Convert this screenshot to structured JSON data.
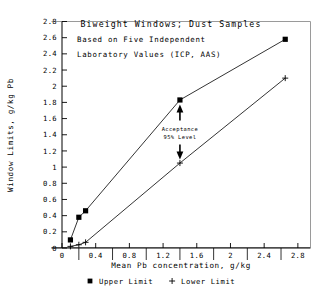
{
  "chart_data": {
    "type": "line",
    "title": "Biweight Windows; Dust Samples",
    "subtitle_lines": [
      "Based on Five Independent",
      "Laboratory Values (ICP, AAS)"
    ],
    "xlabel": "Mean Pb concentration, g/kg",
    "ylabel": "Window Limits, g/kg Pb",
    "xlim": [
      0,
      2.95
    ],
    "ylim": [
      0,
      2.8
    ],
    "xticks": [
      0,
      0.4,
      0.8,
      1.2,
      1.6,
      2,
      2.4,
      2.8
    ],
    "xticklabels": [
      "0",
      "0.4",
      "0.8",
      "1.2",
      "1.6",
      "2",
      "2.4",
      "2.8"
    ],
    "yticks": [
      0,
      0.2,
      0.4,
      0.6,
      0.8,
      1,
      1.2,
      1.4,
      1.6,
      1.8,
      2,
      2.2,
      2.4,
      2.6,
      2.8
    ],
    "yticklabels": [
      "0",
      "0.2",
      "0.4",
      "0.6",
      "0.8",
      "1",
      "1.2",
      "1.4",
      "1.6",
      "1.8",
      "2",
      "2.2",
      "2.4",
      "2.6",
      "2.8"
    ],
    "minor_xticks": [
      0.2,
      0.6,
      1.0,
      1.4,
      1.8,
      2.2,
      2.6
    ],
    "grid": false,
    "legend_position": "below-axis",
    "series": [
      {
        "name": "Upper Limit",
        "marker": "square",
        "x": [
          0.1,
          0.2,
          0.28,
          1.4,
          2.65
        ],
        "y": [
          0.1,
          0.38,
          0.46,
          1.83,
          2.58
        ]
      },
      {
        "name": "Lower Limit",
        "marker": "plus",
        "x": [
          0.1,
          0.2,
          0.28,
          1.4,
          2.65
        ],
        "y": [
          0.02,
          0.04,
          0.07,
          1.05,
          2.1
        ]
      }
    ],
    "annotations": [
      {
        "text_lines": [
          "Acceptance",
          "95% Level"
        ],
        "x": 1.4,
        "y_top": 1.75,
        "y_bottom": 1.12,
        "arrow_up": true,
        "arrow_down": true
      }
    ]
  },
  "legend": {
    "items": [
      {
        "label": "Upper Limit",
        "marker": "square"
      },
      {
        "label": "Lower Limit",
        "marker": "plus"
      }
    ]
  }
}
